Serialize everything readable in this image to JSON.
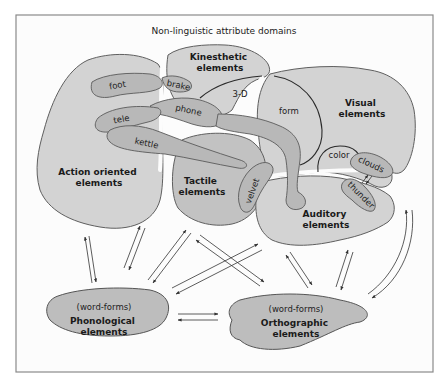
{
  "title": "Non-linguistic attribute domains",
  "domains": {
    "action": {
      "label_line1": "Action oriented",
      "label_line2": "elements"
    },
    "kinesthetic": {
      "label_line1": "Kinesthetic",
      "label_line2": "elements"
    },
    "visual": {
      "label_line1": "Visual",
      "label_line2": "elements"
    },
    "tactile": {
      "label_line1": "Tactile",
      "label_line2": "elements"
    },
    "auditory": {
      "label_line1": "Auditory",
      "label_line2": "elements"
    }
  },
  "subregions": {
    "three_d": "3-D",
    "form": "form",
    "color": "color"
  },
  "concepts": {
    "foot": "foot",
    "brake": "brake",
    "phone": "phone",
    "tele": "tele",
    "kettle": "kettle",
    "velvet": "velvet",
    "clouds": "clouds",
    "thunder": "thunder"
  },
  "linguistic": {
    "phonological": {
      "sub": "(word-forms)",
      "label_line1": "Phonological",
      "label_line2": "elements"
    },
    "orthographic": {
      "sub": "(word-forms)",
      "label_line1": "Orthographic",
      "label_line2": "elements"
    }
  },
  "colors": {
    "domain_fill": "#d3d3d3",
    "concept_fill": "#b8b8b8",
    "linguistic_fill": "#bdbdbd",
    "frame_stroke": "#8a8a8a"
  }
}
